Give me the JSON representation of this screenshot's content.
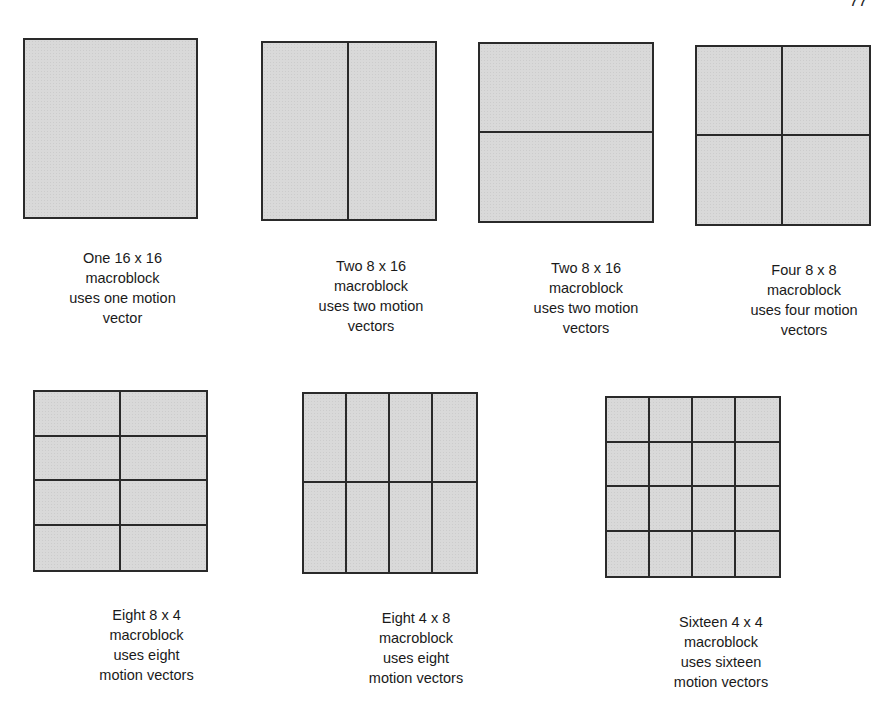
{
  "page_number": "77",
  "blocks": [
    {
      "id": "16x16",
      "cols": 1,
      "rows": 1,
      "x": 23,
      "y": 38,
      "w": 175,
      "h": 181,
      "label": [
        "One 16 x 16",
        "macroblock",
        "uses one motion",
        "vector"
      ],
      "label_x": 30,
      "label_y": 248
    },
    {
      "id": "8x16-vertical",
      "cols": 2,
      "rows": 1,
      "x": 261,
      "y": 41,
      "w": 176,
      "h": 180,
      "label": [
        "Two 8 x 16",
        "macroblock",
        "uses two motion",
        "vectors"
      ],
      "label_x": 278,
      "label_y": 256
    },
    {
      "id": "8x16-horizontal",
      "cols": 1,
      "rows": 2,
      "x": 478,
      "y": 42,
      "w": 176,
      "h": 181,
      "label": [
        "Two 8 x 16",
        "macroblock",
        "uses two motion",
        "vectors"
      ],
      "label_x": 493,
      "label_y": 258
    },
    {
      "id": "8x8",
      "cols": 2,
      "rows": 2,
      "x": 695,
      "y": 45,
      "w": 176,
      "h": 181,
      "label": [
        "Four  8 x 8",
        "macroblock",
        "uses four motion",
        "vectors"
      ],
      "label_x": 711,
      "label_y": 260
    },
    {
      "id": "8x4",
      "cols": 2,
      "rows": 4,
      "x": 33,
      "y": 390,
      "w": 175,
      "h": 182,
      "label": [
        "Eight 8 x 4",
        "macroblock",
        "uses eight",
        "motion vectors"
      ],
      "label_x": 54,
      "label_y": 605
    },
    {
      "id": "4x8",
      "cols": 4,
      "rows": 2,
      "x": 302,
      "y": 392,
      "w": 176,
      "h": 182,
      "label": [
        "Eight 4 x 8",
        "macroblock",
        "uses eight",
        "motion vectors"
      ],
      "label_x": 323,
      "label_y": 608
    },
    {
      "id": "4x4",
      "cols": 4,
      "rows": 4,
      "x": 605,
      "y": 396,
      "w": 176,
      "h": 182,
      "label": [
        "Sixteen 4 x 4",
        "macroblock",
        "uses sixteen",
        "motion vectors"
      ],
      "label_x": 628,
      "label_y": 612
    }
  ]
}
